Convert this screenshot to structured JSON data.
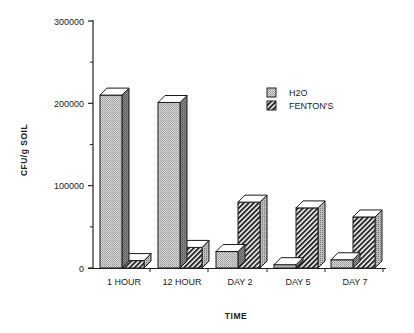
{
  "chart_data": {
    "type": "bar",
    "style": "3d-grouped",
    "title": "",
    "xlabel": "TIME",
    "ylabel": "CFU/g  SOIL",
    "ylim": [
      0,
      300000
    ],
    "yticks": [
      0,
      100000,
      200000,
      300000
    ],
    "yticks_minor": [
      50000,
      150000,
      250000
    ],
    "grid": false,
    "legend_position": "upper-right (inside plot)",
    "categories": [
      "1 HOUR",
      "12 HOUR",
      "DAY 2",
      "DAY 5",
      "DAY 7"
    ],
    "series": [
      {
        "name": "H2O",
        "pattern": "stipple",
        "values": [
          210000,
          201000,
          20000,
          4000,
          10000
        ]
      },
      {
        "name": "FENTON'S",
        "pattern": "diagonal-hatch",
        "values": [
          9000,
          25000,
          80000,
          73000,
          62000
        ]
      }
    ]
  },
  "axis": {
    "y_tick_labels": [
      "0",
      "100000",
      "200000",
      "300000"
    ],
    "x_title": "TIME",
    "y_title": "CFU/g  SOIL"
  },
  "legend": {
    "items": [
      {
        "label": "H2O"
      },
      {
        "label": "FENTON'S"
      }
    ]
  },
  "colors": {
    "h2o_front": "#c9c9c9",
    "h2o_side": "#8a8a8a",
    "fenton_stripe": "#2a2a2a",
    "outline": "#1a1a1a",
    "top_face": "#ffffff"
  }
}
